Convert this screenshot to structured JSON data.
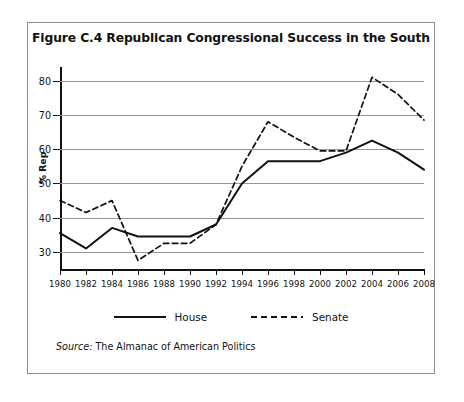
{
  "figure": {
    "title": "Figure C.4  Republican Congressional Success in the South",
    "source_label": "Source:",
    "source_text": " The Almanac of American Politics"
  },
  "legend": {
    "items": [
      {
        "label": "House",
        "style": "solid",
        "color": "#111111"
      },
      {
        "label": "Senate",
        "style": "dashed",
        "color": "#111111"
      }
    ]
  },
  "chart_data": {
    "type": "line",
    "title": "Figure C.4  Republican Congressional Success in the South",
    "xlabel": "",
    "ylabel": "% Rep",
    "x": [
      1980,
      1982,
      1984,
      1986,
      1988,
      1990,
      1992,
      1994,
      1996,
      1998,
      2000,
      2002,
      2004,
      2006,
      2008
    ],
    "xtick_labels": [
      "1980",
      "1982",
      "1984",
      "1986",
      "1988",
      "1990",
      "1992",
      "1994",
      "1996",
      "1998",
      "2000",
      "2002",
      "2004",
      "2006",
      "2008"
    ],
    "ytick_labels": [
      "30",
      "40",
      "50",
      "60",
      "70",
      "80"
    ],
    "yticks": [
      30,
      40,
      50,
      60,
      70,
      80
    ],
    "ylim": [
      25,
      84
    ],
    "xlim": [
      1980,
      2008
    ],
    "grid": true,
    "legend_position": "below",
    "series": [
      {
        "name": "House",
        "style": "solid",
        "color": "#111111",
        "values": [
          35.5,
          31.0,
          37.0,
          34.5,
          34.5,
          34.5,
          38.0,
          50.0,
          56.5,
          56.5,
          56.5,
          59.0,
          62.5,
          59.0,
          54.0
        ]
      },
      {
        "name": "Senate",
        "style": "dashed",
        "color": "#111111",
        "values": [
          45.0,
          41.5,
          45.0,
          27.5,
          32.5,
          32.5,
          38.0,
          55.0,
          68.0,
          63.5,
          59.5,
          59.5,
          81.0,
          76.0,
          68.5
        ]
      }
    ]
  }
}
